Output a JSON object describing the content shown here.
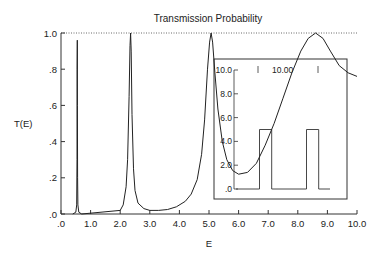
{
  "chart_data": {
    "type": "line",
    "title": "Transmission Probability",
    "xlabel": "E",
    "ylabel": "T(E)",
    "xlim": [
      0,
      10
    ],
    "ylim": [
      0,
      1
    ],
    "x_ticks": [
      ".0",
      "1.0",
      "2.0",
      "3.0",
      "4.0",
      "5.0",
      "6.0",
      "7.0",
      "8.0",
      "9.0",
      "10.0"
    ],
    "y_ticks": [
      ".0",
      ".2",
      ".4",
      ".6",
      ".8",
      "1.0"
    ],
    "reference_line": {
      "y": 1.0,
      "style": "dotted"
    },
    "series": [
      {
        "name": "T(E)",
        "x": [
          0.4,
          0.5,
          0.53,
          0.54,
          0.545,
          0.55,
          0.555,
          0.56,
          0.57,
          0.6,
          0.7,
          2.0,
          2.1,
          2.2,
          2.25,
          2.3,
          2.33,
          2.35,
          2.37,
          2.4,
          2.45,
          2.5,
          2.6,
          2.8,
          3.0,
          3.3,
          3.6,
          3.9,
          4.2,
          4.4,
          4.6,
          4.75,
          4.85,
          4.95,
          5.02,
          5.07,
          5.12,
          5.2,
          5.3,
          5.45,
          5.6,
          5.8,
          6.0,
          6.3,
          6.6,
          6.9,
          7.2,
          7.5,
          7.8,
          8.1,
          8.35,
          8.6,
          8.85,
          9.1,
          9.4,
          9.7,
          10.0
        ],
        "y": [
          0.0,
          0.01,
          0.05,
          0.3,
          0.8,
          0.96,
          0.6,
          0.2,
          0.05,
          0.01,
          0.0,
          0.02,
          0.05,
          0.15,
          0.3,
          0.65,
          0.93,
          1.0,
          0.9,
          0.55,
          0.25,
          0.13,
          0.06,
          0.03,
          0.02,
          0.02,
          0.025,
          0.04,
          0.07,
          0.11,
          0.19,
          0.33,
          0.52,
          0.8,
          0.95,
          1.0,
          0.95,
          0.78,
          0.58,
          0.4,
          0.3,
          0.24,
          0.22,
          0.23,
          0.28,
          0.38,
          0.5,
          0.64,
          0.78,
          0.9,
          0.97,
          1.0,
          0.97,
          0.9,
          0.82,
          0.78,
          0.76
        ]
      }
    ],
    "inset": {
      "description": "Double-barrier potential",
      "y_ticks": [
        ".0",
        "2.0",
        "4.0",
        "6.0",
        "8.0",
        "10.0"
      ],
      "top_label": "10.00",
      "barriers": [
        {
          "x_start": 0.25,
          "x_end": 0.38,
          "height": 5.0
        },
        {
          "x_start": 0.75,
          "x_end": 0.88,
          "height": 5.0
        }
      ]
    }
  }
}
